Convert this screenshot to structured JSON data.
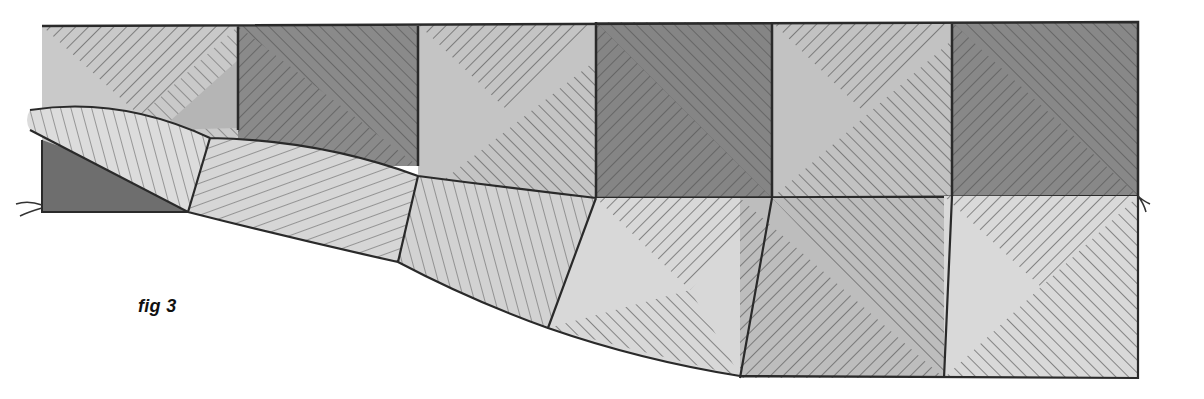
{
  "figure": {
    "caption": "fig 3",
    "top_row": {
      "squares": [
        {
          "index": 0,
          "tone": "light",
          "fill": "#c9c9c9"
        },
        {
          "index": 1,
          "tone": "dark",
          "fill": "#8a8a8a"
        },
        {
          "index": 2,
          "tone": "light",
          "fill": "#c4c4c4"
        },
        {
          "index": 3,
          "tone": "dark",
          "fill": "#858585"
        },
        {
          "index": 4,
          "tone": "light",
          "fill": "#c2c2c2"
        },
        {
          "index": 5,
          "tone": "dark",
          "fill": "#888888"
        }
      ]
    },
    "bottom_row": {
      "squares": [
        {
          "index": 0,
          "tone": "folded-light",
          "fill": "#dcdcdc"
        },
        {
          "index": 1,
          "tone": "folded-light",
          "fill": "#d6d6d6"
        },
        {
          "index": 2,
          "tone": "folded-light",
          "fill": "#d2d2d2"
        },
        {
          "index": 3,
          "tone": "light",
          "fill": "#d8d8d8"
        },
        {
          "index": 4,
          "tone": "mid",
          "fill": "#bdbdbd"
        },
        {
          "index": 5,
          "tone": "light",
          "fill": "#d9d9d9"
        }
      ]
    },
    "colors": {
      "background": "#ffffff",
      "outline": "#2a2a2a",
      "hatch": "#555555",
      "dark_under": "#6e6e6e"
    }
  }
}
